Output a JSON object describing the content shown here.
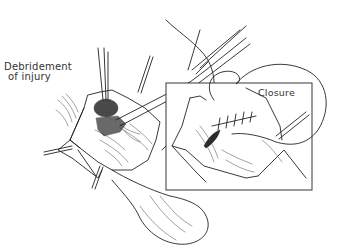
{
  "figure": {
    "type": "surgical-illustration",
    "style": "black ink line drawing on white",
    "labels": {
      "main": "Debridement\nof injury",
      "main_line1": "Debridement",
      "main_line2": "of injury",
      "inset": "Closure"
    },
    "panels": [
      {
        "name": "main-view",
        "description": "Wound retracted with hooks; forceps and scissors debriding injured tissue"
      },
      {
        "name": "inset-closure",
        "description": "Rectangular inset showing sutured closure of the wound"
      }
    ],
    "colors": {
      "ink": "#222222",
      "background": "#ffffff"
    }
  }
}
